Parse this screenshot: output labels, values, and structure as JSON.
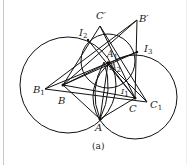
{
  "figure": {
    "caption": "(a)",
    "colors": {
      "stroke": "#111111",
      "background": "#ffffff"
    },
    "labels": {
      "C_prime": "C′",
      "B_prime": "B′",
      "I2": "I",
      "I2_sub": "2",
      "I3": "I",
      "I3_sub": "3",
      "I1": "I",
      "I1_sub": "1",
      "A1": "A",
      "A1_sub": "1",
      "A2": "A",
      "A2_sub": "2",
      "B1": "B",
      "B1_sub": "1",
      "B": "B",
      "C": "C",
      "C1": "C",
      "C1_sub": "1",
      "A_prime": "A′"
    },
    "circles": [
      {
        "name": "left-circle",
        "cx": 68,
        "cy": 85,
        "r": 48
      },
      {
        "name": "right-circle",
        "cx": 135,
        "cy": 97,
        "r": 42
      },
      {
        "name": "top-circle",
        "cx": 108,
        "cy": 61,
        "r": 27
      }
    ]
  }
}
